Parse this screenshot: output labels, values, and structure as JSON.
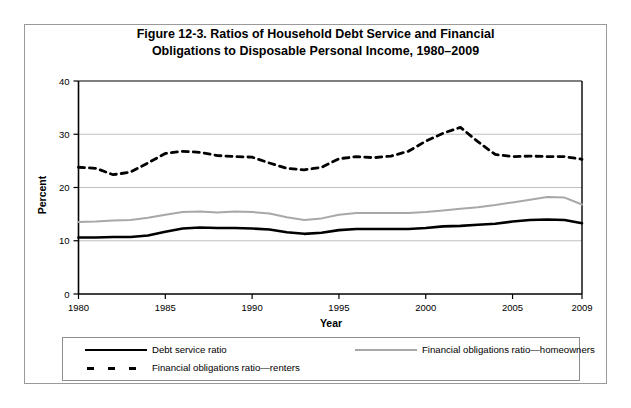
{
  "figure": {
    "title_line1": "Figure 12-3. Ratios of Household Debt Service and Financial",
    "title_line2": "Obligations  to Disposable Personal Income, 1980–2009"
  },
  "legend": {
    "entries": [
      {
        "label": "Debt service ratio",
        "style": "solid-black",
        "color": "#000000"
      },
      {
        "label": "Financial obligations ratio—homeowners",
        "style": "solid-gray",
        "color": "#a8a8a8"
      },
      {
        "label": "Financial obligations ratio—renters",
        "style": "dashed-black",
        "color": "#000000"
      }
    ]
  },
  "chart_data": {
    "type": "line",
    "title": "Figure 12-3. Ratios of Household Debt Service and Financial Obligations  to Disposable Personal Income, 1980–2009",
    "xlabel": "Year",
    "ylabel": "Percent",
    "xlim": [
      1980,
      2009
    ],
    "ylim": [
      0,
      40
    ],
    "ytick_labels": [
      "0",
      "10",
      "20",
      "30",
      "40"
    ],
    "yticks": [
      0,
      10,
      20,
      30,
      40
    ],
    "xtick_labels": [
      "1980",
      "1985",
      "1990",
      "1995",
      "2000",
      "2005",
      "2009"
    ],
    "xticks": [
      1980,
      1985,
      1990,
      1995,
      2000,
      2005,
      2009
    ],
    "grid": "horizontal",
    "legend_position": "below-axes",
    "x": [
      1980,
      1981,
      1982,
      1983,
      1984,
      1985,
      1986,
      1987,
      1988,
      1989,
      1990,
      1991,
      1992,
      1993,
      1994,
      1995,
      1996,
      1997,
      1998,
      1999,
      2000,
      2001,
      2002,
      2003,
      2004,
      2005,
      2006,
      2007,
      2008,
      2009
    ],
    "series": [
      {
        "name": "Debt service ratio",
        "color": "#000000",
        "linestyle": "solid",
        "values": [
          10.6,
          10.6,
          10.7,
          10.7,
          11.0,
          11.7,
          12.3,
          12.5,
          12.4,
          12.4,
          12.3,
          12.1,
          11.6,
          11.3,
          11.5,
          12.0,
          12.2,
          12.2,
          12.2,
          12.2,
          12.4,
          12.7,
          12.8,
          13.0,
          13.2,
          13.6,
          13.9,
          14.0,
          13.9,
          13.3
        ]
      },
      {
        "name": "Financial obligations ratio—homeowners",
        "color": "#a8a8a8",
        "linestyle": "solid",
        "values": [
          13.5,
          13.6,
          13.8,
          13.9,
          14.3,
          14.9,
          15.4,
          15.5,
          15.3,
          15.5,
          15.4,
          15.1,
          14.4,
          13.9,
          14.2,
          14.9,
          15.2,
          15.2,
          15.2,
          15.2,
          15.4,
          15.7,
          16.0,
          16.3,
          16.7,
          17.2,
          17.7,
          18.2,
          18.1,
          16.8
        ]
      },
      {
        "name": "Financial obligations ratio—renters",
        "color": "#000000",
        "linestyle": "dashed",
        "values": [
          23.8,
          23.6,
          22.4,
          22.9,
          24.6,
          26.4,
          26.8,
          26.6,
          26.0,
          25.8,
          25.7,
          24.6,
          23.6,
          23.3,
          23.8,
          25.4,
          25.8,
          25.6,
          25.9,
          26.8,
          28.7,
          30.2,
          31.3,
          28.6,
          26.2,
          25.8,
          25.9,
          25.8,
          25.8,
          25.3
        ]
      }
    ]
  }
}
